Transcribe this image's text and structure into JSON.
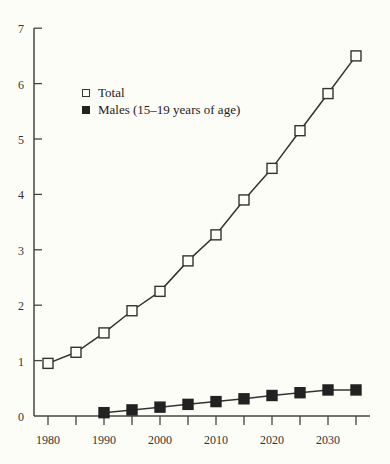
{
  "chart_data": {
    "type": "line",
    "title": "",
    "xlabel": "",
    "ylabel": "",
    "x": [
      1980,
      1985,
      1990,
      1995,
      2000,
      2005,
      2010,
      2015,
      2020,
      2025,
      2030,
      2035
    ],
    "x_tick_labels": [
      "1980",
      "1990",
      "2000",
      "2010",
      "2020",
      "2030"
    ],
    "y_tick_labels": [
      "0",
      "1",
      "2",
      "3",
      "4",
      "5",
      "6",
      "7"
    ],
    "xlim": [
      1977.5,
      2037
    ],
    "ylim": [
      0,
      7
    ],
    "grid": false,
    "legend_position": "upper left",
    "series": [
      {
        "name": "Total",
        "marker": "open-square",
        "values": [
          0.95,
          1.15,
          1.5,
          1.9,
          2.25,
          2.8,
          3.27,
          3.9,
          4.47,
          5.15,
          5.82,
          6.5
        ]
      },
      {
        "name": "Males (15–19 years of age)",
        "marker": "filled-square",
        "values": [
          null,
          null,
          0.06,
          0.11,
          0.16,
          0.21,
          0.26,
          0.31,
          0.37,
          0.42,
          0.47,
          0.47
        ]
      }
    ]
  },
  "legend": {
    "total_label": "Total",
    "males_label": "Males (15–19 years of age)"
  },
  "colors": {
    "background": "#fdfdf8",
    "ink": "#222222"
  }
}
